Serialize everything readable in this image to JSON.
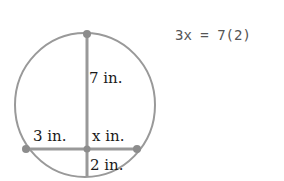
{
  "diagram": {
    "labels": {
      "upper_segment": "7 in.",
      "left_segment": "3 in.",
      "right_segment": "x in.",
      "lower_segment": "2 in."
    },
    "colors": {
      "stroke": "#999999",
      "point": "#8c8c8c",
      "text": "#1a1a1a"
    }
  },
  "equation": {
    "text": "3x = 7(2)"
  }
}
